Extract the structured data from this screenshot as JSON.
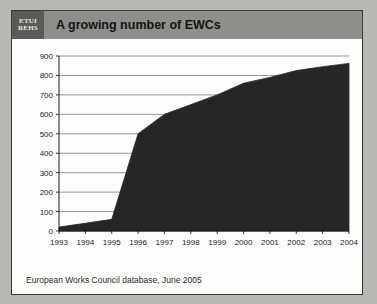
{
  "header": {
    "logo_line1": "ETUI",
    "logo_line2": "REHS",
    "title": "A growing number of EWCs",
    "bar_color": "#8e8e8a",
    "logo_color": "#5a5a56"
  },
  "caption": {
    "text": "European Works Council database, June 2005"
  },
  "chart_data": {
    "type": "area",
    "title": "A growing number of EWCs",
    "xlabel": "",
    "ylabel": "",
    "categories": [
      1993,
      1994,
      1995,
      1996,
      1997,
      1998,
      1999,
      2000,
      2001,
      2002,
      2003,
      2004
    ],
    "x_tick_labels": [
      "1993",
      "1994",
      "1995",
      "1996",
      "1997",
      "1998",
      "1999",
      "2000",
      "2001",
      "2002",
      "2003",
      "2004"
    ],
    "values": [
      20,
      40,
      60,
      500,
      600,
      650,
      700,
      760,
      790,
      825,
      845,
      862
    ],
    "y_tick_labels": [
      "0",
      "100",
      "200",
      "300",
      "400",
      "500",
      "600",
      "700",
      "800",
      "900"
    ],
    "y_ticks": [
      0,
      100,
      200,
      300,
      400,
      500,
      600,
      700,
      800,
      900
    ],
    "ylim": [
      0,
      900
    ],
    "xlim": [
      1993,
      2004
    ],
    "grid": true,
    "grid_axis": "y",
    "legend": false,
    "series_color": "#262626",
    "grid_color": "#8a8a88",
    "axis_color": "#1c1c1c",
    "plot_background": "#fdfdfb"
  }
}
